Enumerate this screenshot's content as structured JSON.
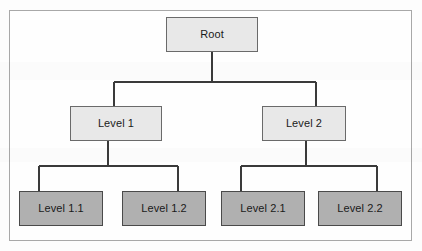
{
  "diagram": {
    "type": "tree",
    "colors": {
      "page_background": "#fdfdfd",
      "frame_border": "#a8a8a8",
      "light_node_fill": "#e8e8e8",
      "light_node_border": "#6a6a6a",
      "dark_node_fill": "#b0b0b0",
      "dark_node_border": "#4a4a4a",
      "edge_stroke": "#3a3a3a",
      "label_text": "#1a1a1a"
    },
    "nodes": [
      {
        "id": "root",
        "label": "Root",
        "level": 0,
        "style": "light",
        "x": 166,
        "y": 17,
        "w": 92,
        "h": 35
      },
      {
        "id": "level1",
        "label": "Level 1",
        "level": 1,
        "style": "light",
        "x": 70,
        "y": 106,
        "w": 92,
        "h": 35
      },
      {
        "id": "level2",
        "label": "Level 2",
        "level": 1,
        "style": "light",
        "x": 262,
        "y": 106,
        "w": 84,
        "h": 35
      },
      {
        "id": "level1_1",
        "label": "Level 1.1",
        "level": 2,
        "style": "dark",
        "x": 19,
        "y": 191,
        "w": 84,
        "h": 35
      },
      {
        "id": "level1_2",
        "label": "Level 1.2",
        "level": 2,
        "style": "dark",
        "x": 122,
        "y": 191,
        "w": 84,
        "h": 35
      },
      {
        "id": "level2_1",
        "label": "Level 2.1",
        "level": 2,
        "style": "dark",
        "x": 221,
        "y": 191,
        "w": 84,
        "h": 35
      },
      {
        "id": "level2_2",
        "label": "Level 2.2",
        "level": 2,
        "style": "dark",
        "x": 318,
        "y": 191,
        "w": 84,
        "h": 35
      }
    ],
    "edges": [
      {
        "id": "root-level1",
        "from": "root",
        "to": "level1",
        "kind": "orthogonal"
      },
      {
        "id": "root-level2",
        "from": "root",
        "to": "level2",
        "kind": "orthogonal"
      },
      {
        "id": "level1-level1_1",
        "from": "level1",
        "to": "level1_1",
        "kind": "orthogonal"
      },
      {
        "id": "level1-level1_2",
        "from": "level1",
        "to": "level1_2",
        "kind": "orthogonal"
      },
      {
        "id": "level2-level2_1",
        "from": "level2",
        "to": "level2_1",
        "kind": "orthogonal"
      },
      {
        "id": "level2-level2_2",
        "from": "level2",
        "to": "level2_2",
        "kind": "orthogonal"
      }
    ]
  }
}
